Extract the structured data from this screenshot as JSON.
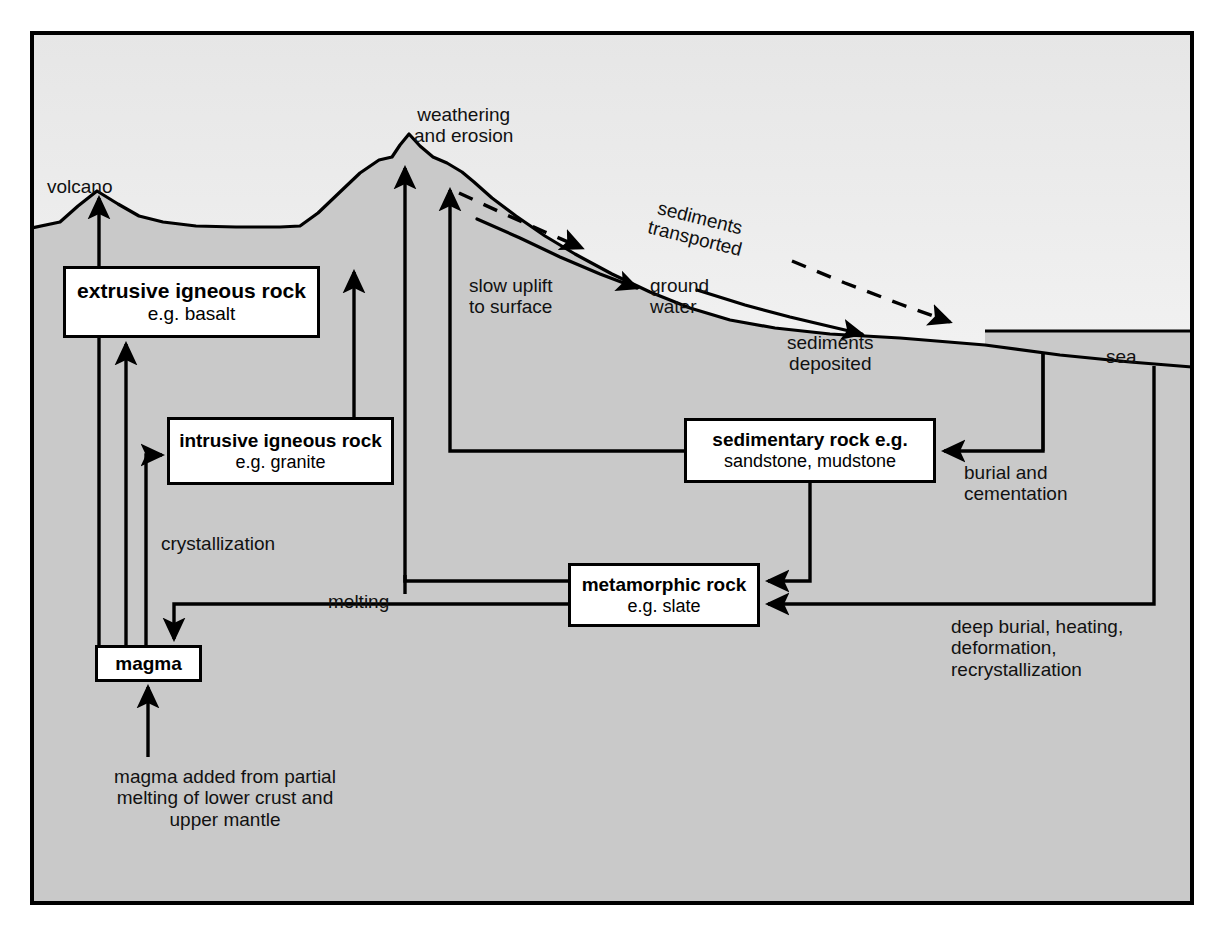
{
  "diagram": {
    "colors": {
      "ground": "#c9c9c9",
      "sky_top": "#e9e9e9",
      "sky_bottom": "#ffffff",
      "line": "#000000",
      "box_fill": "#ffffff",
      "frame": "#000000"
    },
    "boxes": [
      {
        "id": "extrusive",
        "line1": "extrusive igneous rock",
        "line2": "e.g. basalt",
        "x": 63,
        "y": 266,
        "w": 257,
        "h": 72,
        "fs1": 21,
        "fs2": 19
      },
      {
        "id": "intrusive",
        "line1": "intrusive igneous rock",
        "line2": "e.g. granite",
        "x": 167,
        "y": 417,
        "w": 227,
        "h": 68,
        "fs1": 19,
        "fs2": 18
      },
      {
        "id": "sedimentary",
        "line1": "sedimentary rock e.g.",
        "line2": "sandstone, mudstone",
        "x": 684,
        "y": 418,
        "w": 252,
        "h": 65,
        "fs1": 19,
        "fs2": 18
      },
      {
        "id": "metamorphic",
        "line1": "metamorphic rock",
        "line2": "e.g. slate",
        "x": 568,
        "y": 563,
        "w": 192,
        "h": 64,
        "fs1": 19,
        "fs2": 18
      },
      {
        "id": "magma",
        "line1": "magma",
        "line2": "",
        "x": 95,
        "y": 645,
        "w": 107,
        "h": 37,
        "fs1": 19,
        "fs2": 0
      }
    ],
    "labels": [
      {
        "id": "volcano",
        "text": "volcano",
        "x": 47,
        "y": 176,
        "fs": 19,
        "align": "left"
      },
      {
        "id": "weathering-erosion",
        "text": "weathering\nand erosion",
        "x": 414,
        "y": 104,
        "fs": 19,
        "align": "center"
      },
      {
        "id": "sediments-transported",
        "text": "sediments\ntransported",
        "x": 656,
        "y": 206,
        "fs": 19,
        "align": "center",
        "rotate": 14
      },
      {
        "id": "slow-uplift",
        "text": "slow uplift\nto surface",
        "x": 469,
        "y": 275,
        "fs": 19,
        "align": "left"
      },
      {
        "id": "ground-water",
        "text": "ground\nwater",
        "x": 650,
        "y": 275,
        "fs": 19,
        "align": "left"
      },
      {
        "id": "sediments-deposited",
        "text": "sediments\ndeposited",
        "x": 787,
        "y": 332,
        "fs": 19,
        "align": "center"
      },
      {
        "id": "sea",
        "text": "sea",
        "x": 1106,
        "y": 346,
        "fs": 19,
        "align": "center"
      },
      {
        "id": "burial-cementation",
        "text": "burial and\ncementation",
        "x": 964,
        "y": 462,
        "fs": 19,
        "align": "left"
      },
      {
        "id": "crystallization",
        "text": "crystallization",
        "x": 161,
        "y": 533,
        "fs": 19,
        "align": "left"
      },
      {
        "id": "melting",
        "text": "melting",
        "x": 328,
        "y": 591,
        "fs": 19,
        "align": "left"
      },
      {
        "id": "deep-burial",
        "text": "deep burial, heating,\ndeformation,\nrecrystallization",
        "x": 951,
        "y": 616,
        "fs": 19,
        "align": "left"
      },
      {
        "id": "magma-added",
        "text": "magma added from partial\nmelting of lower crust and\nupper mantle",
        "x": 168,
        "y": 766,
        "fs": 19,
        "align": "center"
      }
    ],
    "flow_edges": [
      {
        "from": "magma",
        "to": "surface-volcano",
        "label": "volcano"
      },
      {
        "from": "magma",
        "to": "extrusive",
        "label": ""
      },
      {
        "from": "magma",
        "to": "intrusive",
        "label": "crystallization"
      },
      {
        "from": "extrusive",
        "to": "surface",
        "label": "weathering and erosion"
      },
      {
        "from": "intrusive",
        "to": "surface",
        "label": "weathering and erosion"
      },
      {
        "from": "sedimentary",
        "to": "surface",
        "label": "slow uplift to surface"
      },
      {
        "from": "sedimentary",
        "to": "metamorphic",
        "label": "deep burial, heating, deformation, recrystallization"
      },
      {
        "from": "seafloor",
        "to": "sedimentary",
        "label": "burial and cementation"
      },
      {
        "from": "seafloor-deep",
        "to": "metamorphic",
        "label": "deep burial, heating, deformation, recrystallization"
      },
      {
        "from": "metamorphic",
        "to": "magma",
        "label": "melting"
      },
      {
        "from": "partial-melt",
        "to": "magma",
        "label": "magma added from partial melting of lower crust and upper mantle"
      }
    ]
  }
}
